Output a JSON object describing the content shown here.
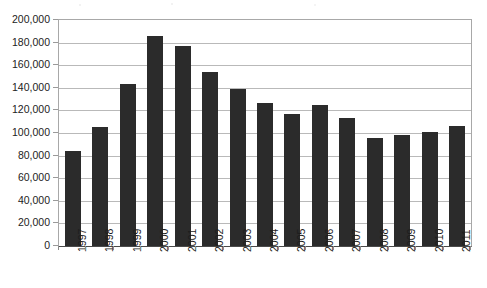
{
  "chart_data": {
    "type": "bar",
    "title": "",
    "subtitle": "",
    "xlabel": "",
    "ylabel": "",
    "categories": [
      "1997",
      "1998",
      "1999",
      "2000",
      "2001",
      "2002",
      "2003",
      "2004",
      "2005",
      "2006",
      "2007",
      "2008",
      "2009",
      "2010",
      "2011"
    ],
    "values": [
      84000,
      105000,
      143000,
      186000,
      177000,
      154000,
      139000,
      127000,
      117000,
      125000,
      113000,
      96000,
      98000,
      101000,
      106000
    ],
    "series": [
      {
        "name": "",
        "values": [
          84000,
          105000,
          143000,
          186000,
          177000,
          154000,
          139000,
          127000,
          117000,
          125000,
          113000,
          96000,
          98000,
          101000,
          106000
        ]
      }
    ],
    "ylim": [
      0,
      200000
    ],
    "ytick_labels": [
      "200,000",
      "180,000",
      "160,000",
      "140,000",
      "120,000",
      "100,000",
      "80,000",
      "60,000",
      "40,000",
      "20,000",
      "0"
    ],
    "ytick_values": [
      200000,
      180000,
      160000,
      140000,
      120000,
      100000,
      80000,
      60000,
      40000,
      20000,
      0
    ],
    "ytick_step": 20000,
    "xtick_labels": [
      "1997",
      "1998",
      "1999",
      "2000",
      "2001",
      "2002",
      "2003",
      "2004",
      "2005",
      "2006",
      "2007",
      "2008",
      "2009",
      "2010",
      "2011"
    ],
    "xlabel_rotation": -90,
    "grid": "horizontal",
    "legend": "none",
    "bar_color": "#2b2b2b",
    "gridline_color": "#b9b9b9",
    "axis_color": "#4a4a4a",
    "plot_background": "#ffffff",
    "annotations": []
  }
}
